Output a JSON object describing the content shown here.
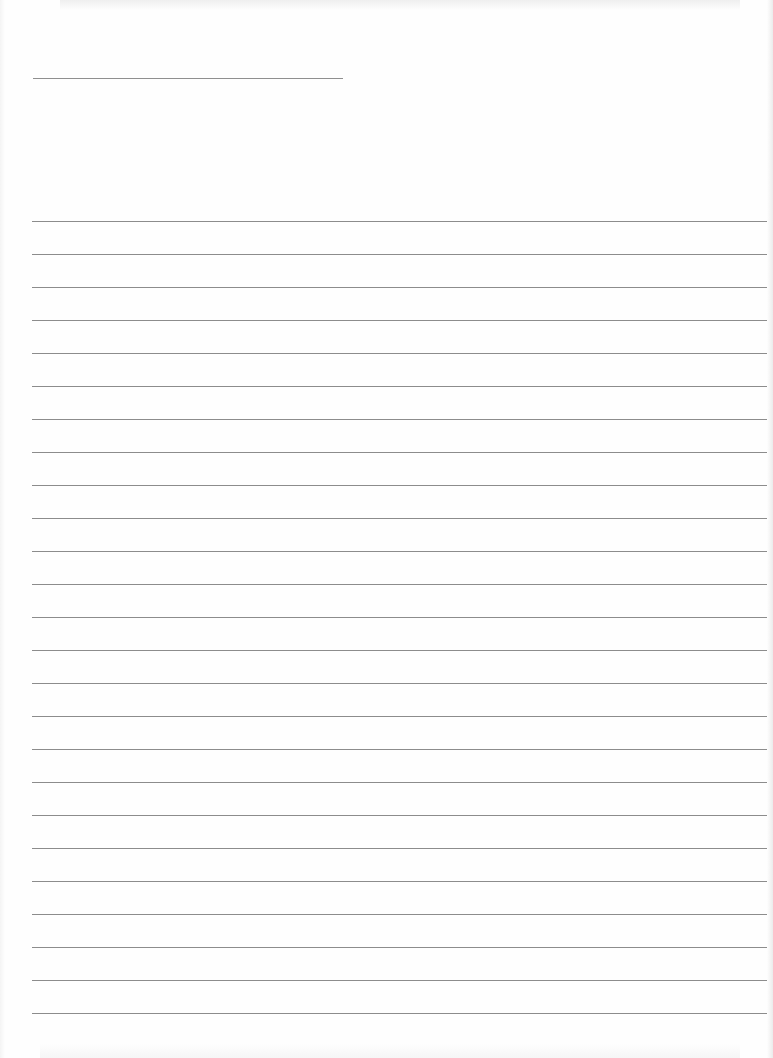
{
  "page": {
    "type": "lined-paper",
    "background_color": "#fefefe",
    "line_color": "#8c8c8c"
  },
  "header_line": {
    "x": 33,
    "y": 78,
    "width": 310
  },
  "ruled_lines": {
    "count": 25,
    "start_y": 221,
    "spacing": 33,
    "x": 32,
    "width": 735
  }
}
